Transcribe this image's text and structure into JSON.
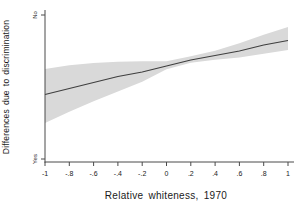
{
  "chart_data": {
    "type": "line",
    "title": "",
    "xlabel": "Relative whiteness, 1970",
    "ylabel": "Differences due to discrimination",
    "x_tick_labels": [
      "-1",
      "-.8",
      "-.6",
      "-.4",
      "-.2",
      "0",
      ".2",
      ".4",
      ".6",
      ".8",
      "1"
    ],
    "x_tick_values": [
      -1,
      -0.8,
      -0.6,
      -0.4,
      -0.2,
      0,
      0.2,
      0.4,
      0.6,
      0.8,
      1
    ],
    "y_tick_labels": [
      "Yes",
      "No"
    ],
    "y_tick_positions": [
      0.02,
      0.98
    ],
    "y_scale_note": "qualitative y axis: values normalized, 0 = Yes (bottom) to 1 = No (top)",
    "xlim": [
      -1,
      1.05
    ],
    "ylim": [
      0,
      1
    ],
    "grid": false,
    "legend": false,
    "x": [
      -1,
      -0.8,
      -0.6,
      -0.4,
      -0.2,
      0,
      0.2,
      0.4,
      0.6,
      0.8,
      1
    ],
    "series": [
      {
        "name": "fitted line",
        "type": "line",
        "color": "#3f3f3f",
        "y": [
          0.45,
          0.49,
          0.53,
          0.57,
          0.6,
          0.64,
          0.68,
          0.71,
          0.74,
          0.78,
          0.81
        ]
      },
      {
        "name": "confidence band",
        "type": "band",
        "color": "#d9d9d9",
        "upper": [
          0.62,
          0.645,
          0.66,
          0.668,
          0.672,
          0.672,
          0.705,
          0.742,
          0.792,
          0.848,
          0.9
        ],
        "lower": [
          0.26,
          0.335,
          0.405,
          0.47,
          0.535,
          0.618,
          0.662,
          0.682,
          0.697,
          0.722,
          0.747
        ]
      }
    ],
    "colors": {
      "band": "#d9d9d9",
      "line": "#3f3f3f",
      "axis": "#4a4a4a",
      "text": "#1a1a1a",
      "background": "#ffffff"
    }
  }
}
